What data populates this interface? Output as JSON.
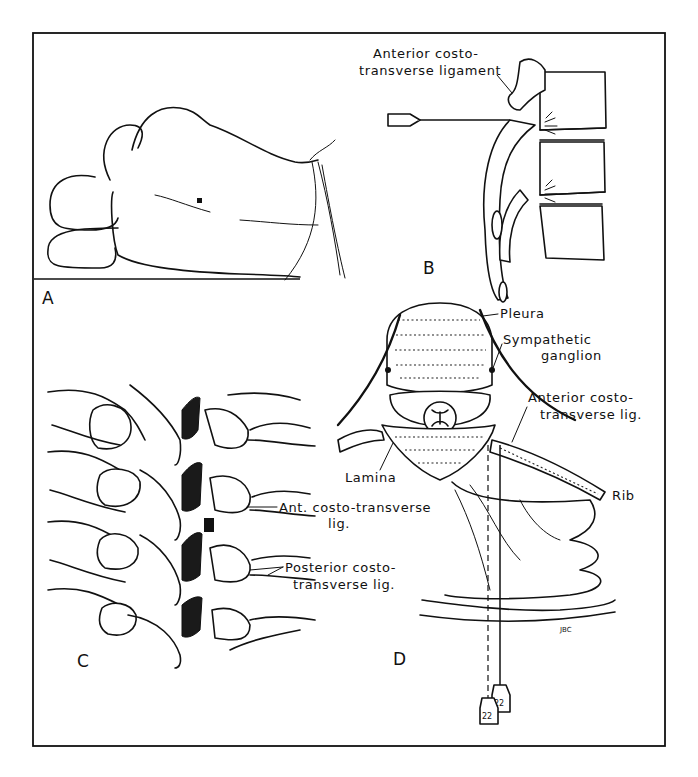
{
  "figure": {
    "panels": [
      {
        "id": "A",
        "label": "A",
        "description": "Patient in lateral decubitus position with injection site marked on back"
      },
      {
        "id": "B",
        "label": "B",
        "description": "Lateral view of thoracic vertebrae with needle reaching anterior costotransverse ligament"
      },
      {
        "id": "C",
        "label": "C",
        "description": "Posterior view of thoracic spine showing costotransverse ligaments"
      },
      {
        "id": "D",
        "label": "D",
        "description": "Cross-section of thoracic vertebra with needles approaching sympathetic ganglion"
      }
    ],
    "labels": {
      "b_anterior_line1": "Anterior costo-",
      "b_anterior_line2": "transverse ligament",
      "c_ant_line1": "Ant. costo-transverse",
      "c_ant_line2": "lig.",
      "c_post_line1": "Posterior costo-",
      "c_post_line2": "transverse lig.",
      "d_pleura": "Pleura",
      "d_sympathetic_line1": "Sympathetic",
      "d_sympathetic_line2": "ganglion",
      "d_anterior_line1": "Anterior costo-",
      "d_anterior_line2": "transverse lig.",
      "d_lamina": "Lamina",
      "d_rib": "Rib",
      "d_signature": "JBC"
    },
    "needles": [
      {
        "gauge_label": "22"
      },
      {
        "gauge_label": "22"
      }
    ],
    "colors": {
      "ink": "#111111",
      "paper": "#ffffff"
    }
  }
}
